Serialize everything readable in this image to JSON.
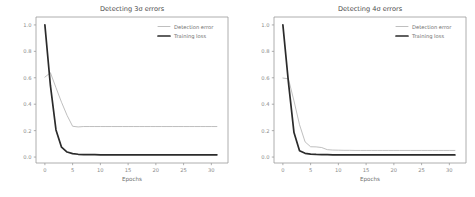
{
  "figure": {
    "background": "#ffffff",
    "width": 475,
    "height": 197
  },
  "colors": {
    "detection_error": "#b4b4b4",
    "training_loss": "#2b2b2b",
    "axis": "#9a9a9a",
    "text": "#6f6f6f",
    "title": "#4a4a4a"
  },
  "chart_data": [
    {
      "type": "line",
      "title": "Detecting 3σ errors",
      "xlabel": "Epochs",
      "ylabel": "",
      "xlim": [
        -1.6,
        33.0
      ],
      "ylim": [
        -0.045,
        1.06
      ],
      "xticks": [
        0,
        5,
        10,
        15,
        20,
        25,
        30
      ],
      "xticklabels": [
        "0",
        "5",
        "10",
        "15",
        "20",
        "25",
        "30"
      ],
      "yticks": [
        0.0,
        0.2,
        0.4,
        0.6,
        0.8,
        1.0
      ],
      "yticklabels": [
        "0.0",
        "0.2",
        "0.4",
        "0.6",
        "0.8",
        "1.0"
      ],
      "grid": false,
      "legend_position": "upper right",
      "x": [
        0,
        1,
        2,
        3,
        4,
        5,
        6,
        7,
        8,
        9,
        10,
        11,
        12,
        13,
        14,
        15,
        16,
        17,
        18,
        19,
        20,
        21,
        22,
        23,
        24,
        25,
        26,
        27,
        28,
        29,
        30,
        31
      ],
      "series": [
        {
          "name": "Detection error",
          "values": [
            0.605,
            0.638,
            0.525,
            0.415,
            0.315,
            0.233,
            0.228,
            0.231,
            0.231,
            0.231,
            0.231,
            0.231,
            0.231,
            0.231,
            0.231,
            0.231,
            0.231,
            0.231,
            0.231,
            0.231,
            0.231,
            0.231,
            0.231,
            0.231,
            0.231,
            0.231,
            0.231,
            0.231,
            0.231,
            0.231,
            0.231,
            0.231
          ]
        },
        {
          "name": "Training loss",
          "values": [
            1.0,
            0.54,
            0.205,
            0.075,
            0.038,
            0.026,
            0.021,
            0.019,
            0.018,
            0.018,
            0.017,
            0.017,
            0.017,
            0.017,
            0.017,
            0.017,
            0.017,
            0.017,
            0.017,
            0.017,
            0.017,
            0.017,
            0.017,
            0.017,
            0.017,
            0.017,
            0.017,
            0.017,
            0.017,
            0.017,
            0.017,
            0.017
          ]
        }
      ]
    },
    {
      "type": "line",
      "title": "Detecting 4σ errors",
      "xlabel": "Epochs",
      "ylabel": "",
      "xlim": [
        -1.6,
        33.0
      ],
      "ylim": [
        -0.045,
        1.06
      ],
      "xticks": [
        0,
        5,
        10,
        15,
        20,
        25,
        30
      ],
      "xticklabels": [
        "0",
        "5",
        "10",
        "15",
        "20",
        "25",
        "30"
      ],
      "yticks": [
        0.0,
        0.2,
        0.4,
        0.6,
        0.8,
        1.0
      ],
      "yticklabels": [
        "0.0",
        "0.2",
        "0.4",
        "0.6",
        "0.8",
        "1.0"
      ],
      "grid": false,
      "legend_position": "upper right",
      "x": [
        0,
        1,
        2,
        3,
        4,
        5,
        6,
        7,
        8,
        9,
        10,
        11,
        12,
        13,
        14,
        15,
        16,
        17,
        18,
        19,
        20,
        21,
        22,
        23,
        24,
        25,
        26,
        27,
        28,
        29,
        30,
        31
      ],
      "series": [
        {
          "name": "Detection error",
          "values": [
            0.598,
            0.592,
            0.425,
            0.245,
            0.115,
            0.078,
            0.077,
            0.072,
            0.056,
            0.053,
            0.052,
            0.051,
            0.051,
            0.05,
            0.05,
            0.05,
            0.05,
            0.05,
            0.05,
            0.05,
            0.05,
            0.05,
            0.05,
            0.05,
            0.05,
            0.05,
            0.05,
            0.05,
            0.05,
            0.05,
            0.05,
            0.05
          ]
        },
        {
          "name": "Training loss",
          "values": [
            1.0,
            0.565,
            0.185,
            0.048,
            0.028,
            0.022,
            0.02,
            0.019,
            0.018,
            0.017,
            0.017,
            0.016,
            0.016,
            0.016,
            0.016,
            0.016,
            0.016,
            0.016,
            0.016,
            0.016,
            0.016,
            0.016,
            0.016,
            0.016,
            0.016,
            0.016,
            0.016,
            0.016,
            0.016,
            0.016,
            0.016,
            0.016
          ]
        }
      ]
    }
  ]
}
